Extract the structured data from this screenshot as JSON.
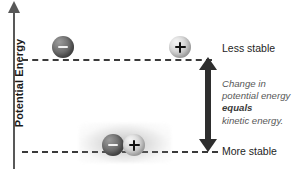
{
  "figure": {
    "type": "potential-energy-diagram",
    "background_color": "#ffffff"
  },
  "axis": {
    "label": "Potential Energy",
    "direction": "upward",
    "color": "#585858"
  },
  "levels": [
    {
      "id": "upper",
      "label": "Less stable",
      "line_style": "dashed",
      "color": "#3a3a3a"
    },
    {
      "id": "lower",
      "label": "More stable",
      "line_style": "dashed",
      "color": "#3a3a3a"
    }
  ],
  "charges": [
    {
      "id": "top-negative",
      "sign": "−",
      "name": "negative-charge",
      "shade": "dark",
      "level": "upper"
    },
    {
      "id": "top-positive",
      "sign": "+",
      "name": "positive-charge",
      "shade": "light",
      "level": "upper"
    },
    {
      "id": "bottom-negative",
      "sign": "−",
      "name": "negative-charge",
      "shade": "dark",
      "level": "lower"
    },
    {
      "id": "bottom-positive",
      "sign": "+",
      "name": "positive-charge",
      "shade": "light",
      "level": "lower"
    }
  ],
  "arrow": {
    "style": "double-headed",
    "color": "#2e2e2e",
    "spans_levels": [
      "upper",
      "lower"
    ]
  },
  "annotation": {
    "line1": "Change in",
    "line2": "potential energy",
    "emphasis": "equals",
    "line4": "kinetic energy.",
    "color": "#585858"
  },
  "chart_data": {
    "type": "diagram",
    "title": "",
    "ylabel": "Potential Energy",
    "xlabel": "",
    "levels": [
      {
        "name": "Less stable",
        "y": 1,
        "description": "separated opposite charges"
      },
      {
        "name": "More stable",
        "y": 0,
        "description": "paired opposite charges"
      }
    ],
    "annotations": [
      "Change in potential energy equals kinetic energy."
    ]
  }
}
